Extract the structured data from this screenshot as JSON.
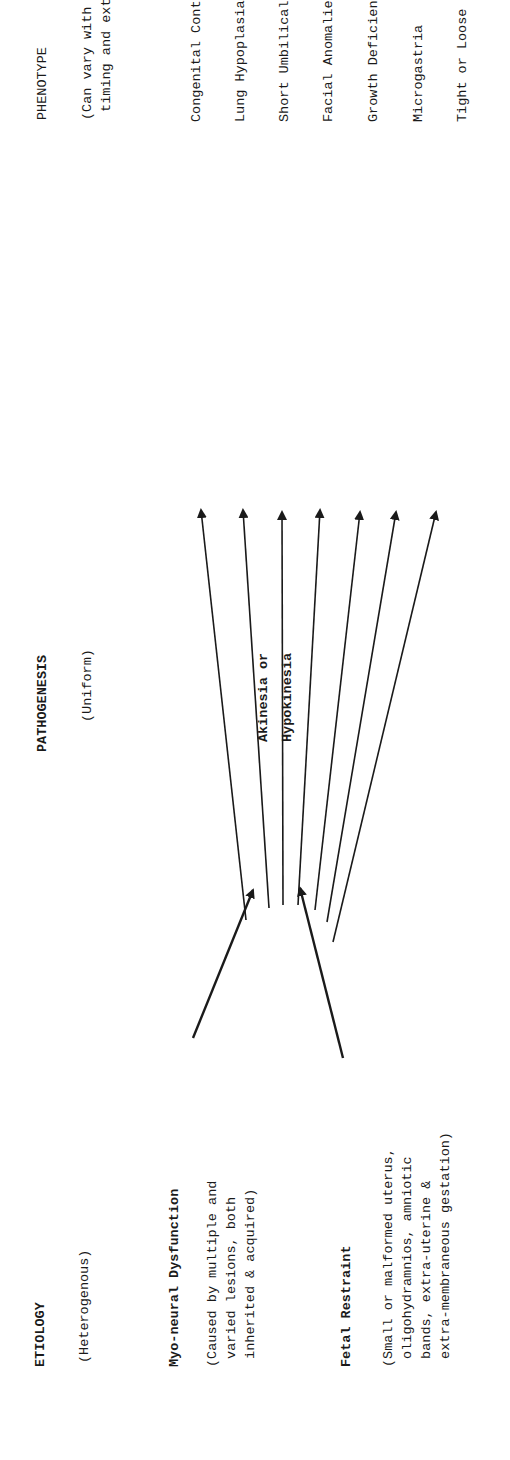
{
  "diagram": {
    "orientation": "rotated 90 degrees counter-clockwise",
    "columns": {
      "etiology": {
        "heading": "ETIOLOGY",
        "subheading": "(Heterogenous)",
        "causes": [
          {
            "title": "Myo-neural Dysfunction",
            "description": "(Caused by multiple and\n varied lesions, both\n inherited & acquired)"
          },
          {
            "title": "Fetal Restraint",
            "description": "(Small or malformed uterus,\n oligohydramnios, amniotic\n bands, extra-uterine &\n extra-membraneous gestation)"
          }
        ]
      },
      "pathogenesis": {
        "heading": "PATHOGENESIS",
        "subheading": "(Uniform)",
        "node": "Akinesia or\nHypokinesia"
      },
      "phenotype": {
        "heading": "PHENOTYPE",
        "subheading": "(Can vary with the nature,\n timing and extent of akinesia)",
        "items": [
          "Congenital Contractures *",
          "Lung Hypoplasia *",
          "Short Umbilical Cord *",
          "Facial Anomalies",
          "Growth Deficiency",
          "Microgastria",
          "Tight or Loose Skin **"
        ]
      }
    },
    "edges": [
      {
        "from": "Myo-neural Dysfunction",
        "to": "Akinesia or Hypokinesia"
      },
      {
        "from": "Fetal Restraint",
        "to": "Akinesia or Hypokinesia"
      },
      {
        "from": "Akinesia or Hypokinesia",
        "to": "Congenital Contractures *"
      },
      {
        "from": "Akinesia or Hypokinesia",
        "to": "Lung Hypoplasia *"
      },
      {
        "from": "Akinesia or Hypokinesia",
        "to": "Short Umbilical Cord *"
      },
      {
        "from": "Akinesia or Hypokinesia",
        "to": "Facial Anomalies"
      },
      {
        "from": "Akinesia or Hypokinesia",
        "to": "Growth Deficiency"
      },
      {
        "from": "Akinesia or Hypokinesia",
        "to": "Microgastria"
      },
      {
        "from": "Akinesia or Hypokinesia",
        "to": "Tight or Loose Skin **"
      }
    ],
    "colors": {
      "ink": "#1a1a1a",
      "background": "#ffffff"
    }
  }
}
